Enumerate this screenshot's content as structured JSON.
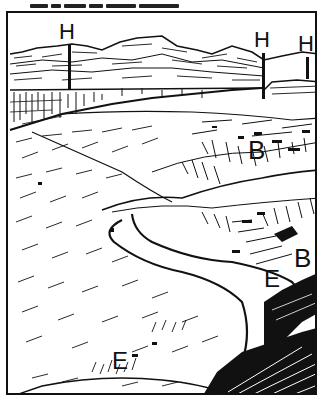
{
  "figure": {
    "type": "pen-and-ink landscape sketch",
    "colors": {
      "ink": "#111111",
      "paper": "#ffffff"
    },
    "labels": {
      "h1": "H",
      "h2": "H",
      "h3": "H",
      "b1": "B",
      "b2": "B",
      "e1": "E",
      "e2": "E"
    }
  }
}
